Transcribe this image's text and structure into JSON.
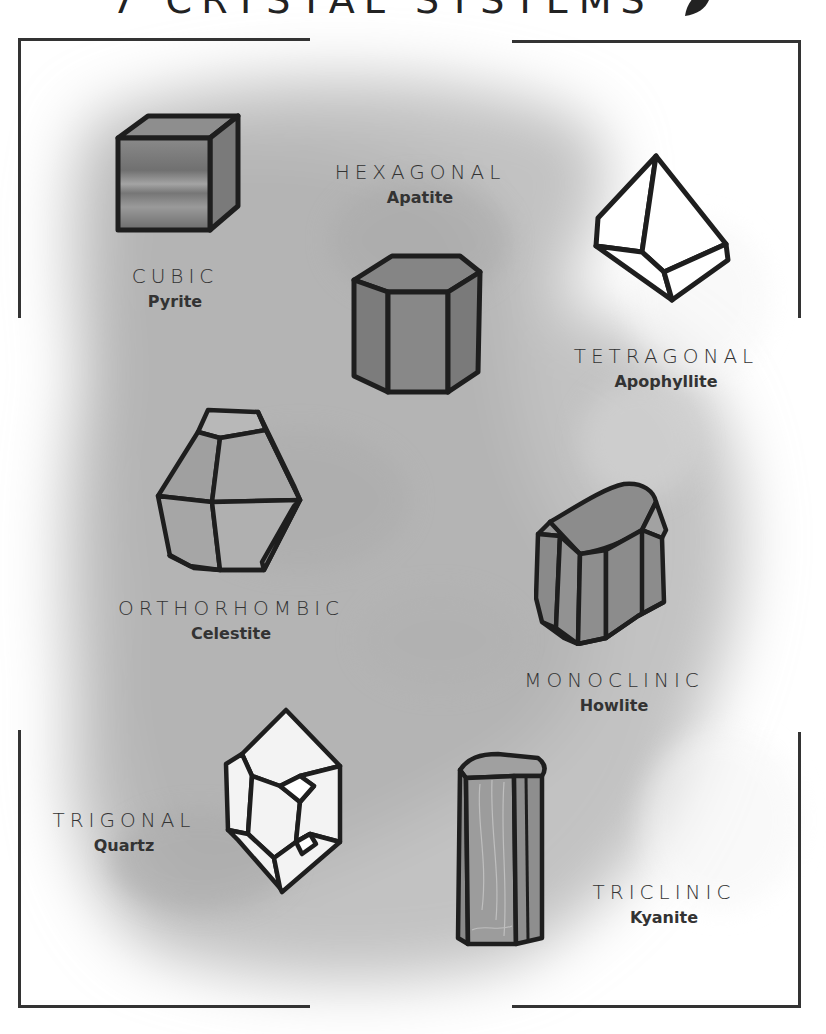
{
  "title": "7 CRYSTAL SYSTEMS",
  "title_icon": "gem-leaf-icon",
  "colors": {
    "stroke": "#1e1e1e",
    "frame": "#333333",
    "text": "#2a2a2a",
    "wash": "#bdbdbd"
  },
  "systems": [
    {
      "system": "CUBIC",
      "mineral": "Pyrite",
      "crystal_icon": "cube-crystal-icon"
    },
    {
      "system": "HEXAGONAL",
      "mineral": "Apatite",
      "crystal_icon": "hexagonal-prism-crystal-icon"
    },
    {
      "system": "TETRAGONAL",
      "mineral": "Apophyllite",
      "crystal_icon": "tetragonal-bipyramid-crystal-icon"
    },
    {
      "system": "ORTHORHOMBIC",
      "mineral": "Celestite",
      "crystal_icon": "orthorhombic-crystal-icon"
    },
    {
      "system": "MONOCLINIC",
      "mineral": "Howlite",
      "crystal_icon": "monoclinic-crystal-icon"
    },
    {
      "system": "TRIGONAL",
      "mineral": "Quartz",
      "crystal_icon": "trigonal-crystal-icon"
    },
    {
      "system": "TRICLINIC",
      "mineral": "Kyanite",
      "crystal_icon": "triclinic-crystal-icon"
    }
  ]
}
